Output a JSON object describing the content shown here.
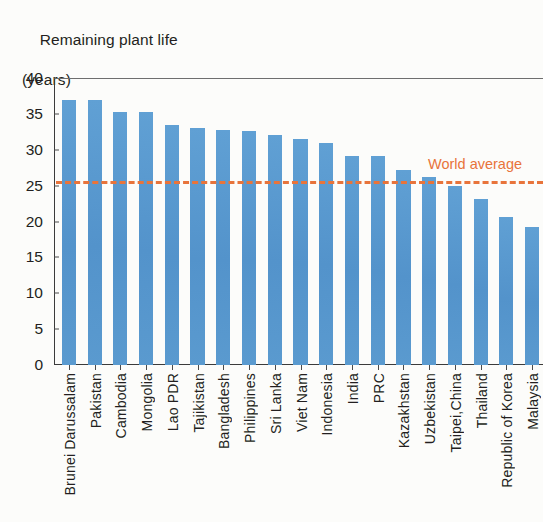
{
  "chart_data": {
    "type": "bar",
    "title": "Remaining plant life",
    "subtitle": "(years)",
    "title_line1": "Remaining plant life",
    "title_line2": "(years)",
    "xlabel": "",
    "ylabel": "Remaining plant life (years)",
    "ylim": [
      0,
      40
    ],
    "yticks": [
      0,
      5,
      10,
      15,
      20,
      25,
      30,
      35,
      40
    ],
    "ytick_labels": [
      "0",
      "5",
      "10",
      "15",
      "20",
      "25",
      "30",
      "35",
      "40"
    ],
    "grid": false,
    "legend": "none",
    "bar_color": "#5b9bd0",
    "categories": [
      "Brunei Darussalam",
      "Pakistan",
      "Cambodia",
      "Mongolia",
      "Lao PDR",
      "Tajikistan",
      "Bangladesh",
      "Philippines",
      "Sri Lanka",
      "Viet Nam",
      "Indonesia",
      "India",
      "PRC",
      "Kazakhstan",
      "Uzbekistan",
      "Taipei,China",
      "Thailand",
      "Republic of Korea",
      "Malaysia"
    ],
    "values": [
      37.0,
      37.0,
      35.3,
      35.2,
      33.4,
      33.0,
      32.7,
      32.6,
      32.0,
      31.5,
      31.0,
      29.1,
      29.1,
      27.2,
      26.2,
      25.0,
      23.2,
      20.6,
      19.2
    ],
    "annotations": [
      {
        "name": "world-average",
        "label": "World average",
        "type": "hline",
        "value": 25.7,
        "color": "#e8743b",
        "style": "dashed",
        "label_position": "top-right"
      }
    ]
  }
}
